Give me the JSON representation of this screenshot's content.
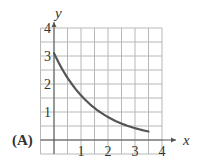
{
  "panel_label": "(A)",
  "colors": {
    "grid": "#b8b8b8",
    "axis": "#555555",
    "curve": "#555555",
    "text": "#333333"
  },
  "chart_data": {
    "type": "line",
    "title": "",
    "xlabel": "x",
    "ylabel": "y",
    "xlim": [
      -0.5,
      4
    ],
    "ylim": [
      -0.5,
      4
    ],
    "x_ticks": [
      "1",
      "2",
      "3",
      "4"
    ],
    "y_ticks": [
      "1",
      "2",
      "3",
      "4"
    ],
    "grid": true,
    "grid_step": 0.5,
    "series": [
      {
        "name": "curve",
        "x": [
          0,
          0.5,
          1,
          1.5,
          2,
          2.5,
          3,
          3.5
        ],
        "y": [
          3.1,
          2.5,
          2.0,
          1.6,
          1.2,
          0.85,
          0.55,
          0.3
        ]
      }
    ]
  }
}
